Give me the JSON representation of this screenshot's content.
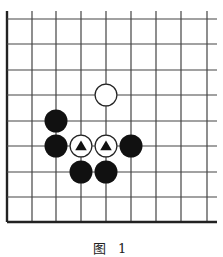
{
  "diagram": {
    "type": "go-board-fragment",
    "caption": "图 1",
    "grid": {
      "columns": 9,
      "rows": 9,
      "x_lines": [
        7,
        32,
        56,
        81,
        106,
        131,
        156,
        181,
        207
      ],
      "y_lines": [
        19,
        44,
        70,
        95,
        121,
        146,
        172,
        197,
        222
      ],
      "right_extend_to": 217,
      "top_extend_from": 11,
      "edges": [
        "left",
        "bottom"
      ],
      "line_color": "#444444",
      "edge_color": "#222222"
    },
    "stone_radius": 11.5,
    "stones": [
      {
        "color": "white",
        "col": 4,
        "row": 3,
        "marker": null
      },
      {
        "color": "black",
        "col": 2,
        "row": 4,
        "marker": null
      },
      {
        "color": "black",
        "col": 2,
        "row": 5,
        "marker": null
      },
      {
        "color": "white",
        "col": 3,
        "row": 5,
        "marker": "triangle"
      },
      {
        "color": "white",
        "col": 4,
        "row": 5,
        "marker": "triangle"
      },
      {
        "color": "black",
        "col": 5,
        "row": 5,
        "marker": null
      },
      {
        "color": "black",
        "col": 3,
        "row": 6,
        "marker": null
      },
      {
        "color": "black",
        "col": 4,
        "row": 6,
        "marker": null
      }
    ],
    "colors": {
      "black_stone": "#111111",
      "white_stone_fill": "#ffffff",
      "white_stone_stroke": "#222222",
      "triangle_marker": "#111111"
    }
  }
}
